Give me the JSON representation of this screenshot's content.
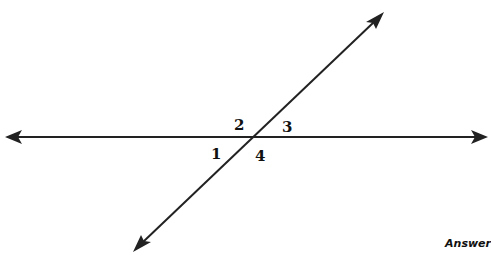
{
  "diagram": {
    "type": "intersecting-lines",
    "line_color": "#222222",
    "horizontal_line": {
      "x1": 18,
      "y1": 137,
      "x2": 474,
      "y2": 137,
      "arrows": "both"
    },
    "transversal": {
      "x1": 374,
      "y1": 22,
      "x2": 143,
      "y2": 242,
      "arrows": "both"
    },
    "angle_labels": [
      {
        "id": "1",
        "text": "1",
        "x": 211,
        "y": 147
      },
      {
        "id": "2",
        "text": "2",
        "x": 234,
        "y": 118
      },
      {
        "id": "3",
        "text": "3",
        "x": 282,
        "y": 120
      },
      {
        "id": "4",
        "text": "4",
        "x": 255,
        "y": 149
      }
    ]
  },
  "footer": {
    "answer_label": "Answer"
  }
}
